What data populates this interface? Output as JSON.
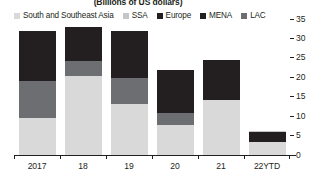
{
  "chart_data": {
    "type": "bar",
    "subtitle": "(Billions of US dollars)",
    "title": "",
    "xlabel": "",
    "ylabel": "",
    "stacked": true,
    "orientation": "vertical",
    "grid": false,
    "legend_position": "top",
    "ylim": [
      0,
      35
    ],
    "yticks": [
      35,
      30,
      25,
      20,
      15,
      10,
      5,
      0
    ],
    "ytick_labels": [
      "35",
      "30",
      "25",
      "20",
      "15",
      "10",
      "5",
      "0"
    ],
    "categories": [
      "2017",
      "18",
      "19",
      "20",
      "21",
      "22YTD"
    ],
    "series": [
      {
        "name": "South and Southeast Asia",
        "color": "#d9d9d9",
        "values": [
          9.5,
          20.3,
          13.1,
          7.7,
          14.1,
          3.3
        ]
      },
      {
        "name": "SSA",
        "color": "#c6c6c6",
        "values": [
          0.0,
          0.0,
          0.0,
          0.0,
          0.0,
          0.3
        ]
      },
      {
        "name": "Europe",
        "color": "#231f20",
        "values": [
          12.9,
          8.7,
          12.1,
          11.1,
          10.3,
          2.6
        ]
      },
      {
        "name": "MENA",
        "color": "#6d6e71",
        "values": [
          9.6,
          4.0,
          6.8,
          3.2,
          0.0,
          0.0
        ]
      },
      {
        "name": "LAC",
        "color": "#808285",
        "values": [
          0.0,
          0.0,
          0.0,
          0.0,
          0.0,
          0.0
        ]
      }
    ]
  },
  "legend": {
    "items": [
      {
        "label": "South and Southeast Asia",
        "color": "#d9d9d9"
      },
      {
        "label": "SSA",
        "color": "#c6c6c6"
      },
      {
        "label": "Europe",
        "color": "#231f20"
      },
      {
        "label": "MENA",
        "color": "#231f20"
      },
      {
        "label": "LAC",
        "color": "#6d6e71"
      }
    ]
  },
  "axis": {
    "y_ticks": [
      "35",
      "30",
      "25",
      "20",
      "15",
      "10",
      "5",
      "0"
    ],
    "x_labels": [
      "2017",
      "18",
      "19",
      "20",
      "21",
      "22YTD"
    ]
  },
  "colors": {
    "sseasia": "#d9d9d9",
    "ssa": "#c6c6c6",
    "europe": "#231f20",
    "mena": "#6d6e71",
    "lac": "#808285",
    "axis": "#231f20",
    "background": "#ffffff"
  }
}
